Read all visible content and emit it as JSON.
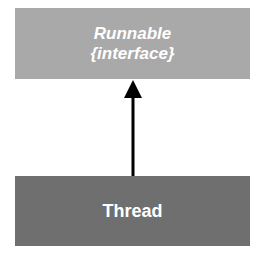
{
  "diagram": {
    "type": "uml-class-relationship",
    "nodes": [
      {
        "id": "runnable",
        "name": "Runnable",
        "stereotype": "{interface}",
        "fill": "#a9a9a9",
        "text_color": "#ffffff"
      },
      {
        "id": "thread",
        "name": "Thread",
        "fill": "#6f6f6f",
        "text_color": "#ffffff"
      }
    ],
    "edges": [
      {
        "from": "thread",
        "to": "runnable",
        "kind": "implements",
        "arrowhead": "filled-triangle",
        "color": "#000000"
      }
    ]
  }
}
